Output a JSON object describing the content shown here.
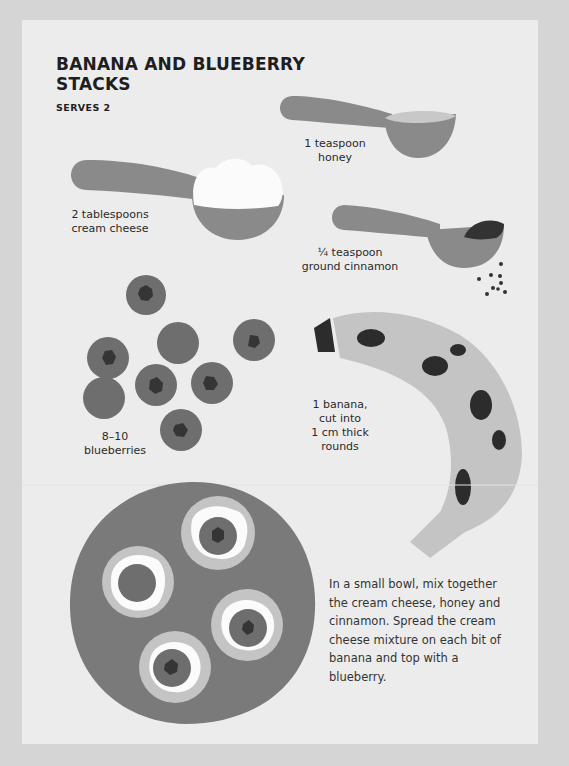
{
  "recipe": {
    "title": "BANANA AND BLUEBERRY STACKS",
    "serves": "SERVES 2"
  },
  "ingredients": {
    "honey": {
      "line1": "1 teaspoon",
      "line2": "honey"
    },
    "cream_cheese": {
      "line1": "2 tablespoons",
      "line2": "cream cheese"
    },
    "cinnamon": {
      "line1": "¼ teaspoon",
      "line2": "ground cinnamon"
    },
    "blueberries": {
      "line1": "8–10",
      "line2": "blueberries"
    },
    "banana": {
      "line1": "1 banana,",
      "line2": "cut into",
      "line3": "1 cm thick",
      "line4": "rounds"
    }
  },
  "instructions": "In a small bowl, mix together the cream cheese, honey and cinnamon. Spread the cream cheese mixture on each bit of banana and top with a blueberry.",
  "colors": {
    "outer_bg": "#d5d5d5",
    "page_bg": "#ececec",
    "spoon": "#8a8a8a",
    "honey": "#c8c8c8",
    "cream": "#fbfbfb",
    "cinnamon": "#333333",
    "blueberry": "#6e6e6e",
    "blueberry_center": "#353535",
    "banana": "#c4c4c4",
    "banana_spot": "#2c2c2c",
    "plate": "#7a7a7a"
  }
}
